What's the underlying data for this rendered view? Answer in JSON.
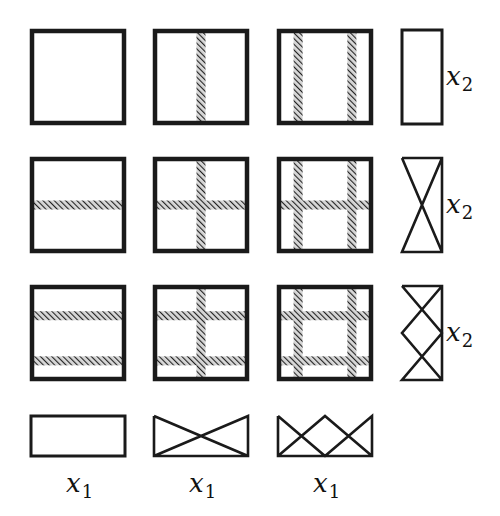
{
  "diagram": {
    "colors": {
      "stroke": "#1a1a1a",
      "hatch": "#333333",
      "background": "#ffffff"
    },
    "grid": [
      [
        {
          "vertical_bands": 0,
          "horizontal_bands": 0
        },
        {
          "vertical_bands": 1,
          "horizontal_bands": 0
        },
        {
          "vertical_bands": 2,
          "horizontal_bands": 0
        }
      ],
      [
        {
          "vertical_bands": 0,
          "horizontal_bands": 1
        },
        {
          "vertical_bands": 1,
          "horizontal_bands": 1
        },
        {
          "vertical_bands": 2,
          "horizontal_bands": 1
        }
      ],
      [
        {
          "vertical_bands": 0,
          "horizontal_bands": 2
        },
        {
          "vertical_bands": 1,
          "horizontal_bands": 2
        },
        {
          "vertical_bands": 2,
          "horizontal_bands": 2
        }
      ]
    ],
    "right_column": [
      {
        "shape": "plain-rectangle",
        "label": "x",
        "subscript": "2"
      },
      {
        "shape": "one-crossing",
        "label": "x",
        "subscript": "2"
      },
      {
        "shape": "two-crossings",
        "label": "x",
        "subscript": "2"
      }
    ],
    "bottom_row": [
      {
        "shape": "plain-rectangle",
        "label": "x",
        "subscript": "1"
      },
      {
        "shape": "one-crossing",
        "label": "x",
        "subscript": "1"
      },
      {
        "shape": "two-crossings",
        "label": "x",
        "subscript": "1"
      }
    ]
  }
}
